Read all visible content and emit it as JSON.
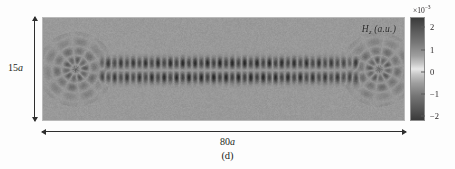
{
  "figure": {
    "caption": "(d)",
    "field_label": {
      "symbol": "H",
      "subscript": "z",
      "units": "(a.u.)"
    },
    "dimensions": {
      "vertical_label": "15",
      "vertical_unit": "a",
      "horizontal_label": "80",
      "horizontal_unit": "a"
    },
    "colorbar": {
      "exponent_prefix": "×10",
      "exponent_power": "−3",
      "ticks": [
        "2",
        "1",
        "0",
        "−1",
        "−2"
      ],
      "colormap": "grayscale-symmetric",
      "background_hex": "#9a9a9a",
      "dark_hex": "#3a3a3a",
      "light_hex": "#e8e8e8"
    }
  },
  "chart_data": {
    "type": "heatmap",
    "title": "",
    "subtitle": "(d)",
    "xlabel": "80a",
    "ylabel": "15a",
    "legend_label": "Hz (a.u.)",
    "grid": false,
    "legend_position": "right",
    "colorbar_scale": 0.001,
    "colorbar_exponent_text": "×10⁻³",
    "zlim": [
      -0.0025,
      0.0025
    ],
    "ztick_values": [
      0.002,
      0.001,
      0.0,
      -0.001,
      -0.002
    ],
    "ztick_labels": [
      "2",
      "1",
      "0",
      "−1",
      "−2"
    ],
    "xlim": [
      0,
      80
    ],
    "ylim": [
      0,
      15
    ],
    "x_extent_units": "a",
    "y_extent_units": "a",
    "colormap": "gray",
    "waveguide": {
      "row_count": 2,
      "row_y_fraction": [
        0.44,
        0.58
      ],
      "lobe_count_per_row": 42,
      "lobe_spacing_fraction": 0.0172,
      "guide_x_start_fraction": 0.155,
      "guide_x_end_fraction": 0.875,
      "peak_amplitude": 0.0025,
      "sign_alternation": "alternating"
    },
    "terminations": [
      {
        "side": "left",
        "center_fraction": [
          0.09,
          0.5
        ],
        "type": "radiating-scatter",
        "ring_count": 4
      },
      {
        "side": "right",
        "center_fraction": [
          0.93,
          0.5
        ],
        "type": "radiating-scatter",
        "ring_count": 4
      }
    ]
  }
}
